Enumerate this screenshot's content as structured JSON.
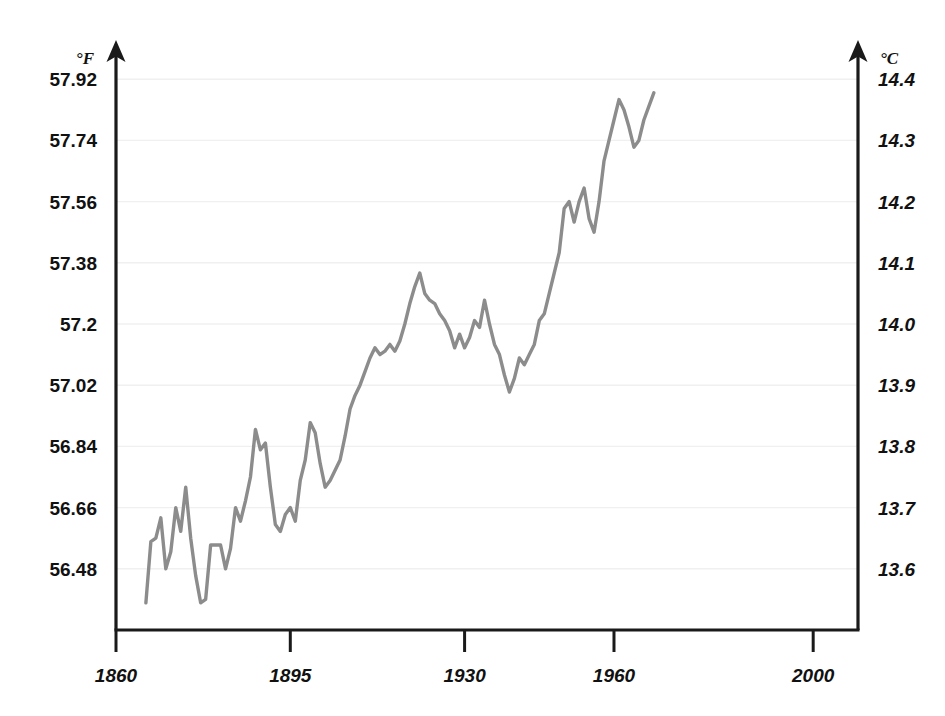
{
  "chart_data": {
    "type": "line",
    "title": "",
    "subtitle": "",
    "xlabel": "",
    "ylabel": "",
    "grid": true,
    "legend": null,
    "line_color": "#8c8c8c",
    "axis_color": "#1a1a1a",
    "grid_color": "#f0f0f0",
    "background": "#ffffff",
    "left_axis": {
      "unit": "°F",
      "ticks": [
        "56.48",
        "56.66",
        "56.84",
        "57.02",
        "57.2",
        "57.38",
        "57.56",
        "57.74",
        "57.92"
      ],
      "values": [
        56.48,
        56.66,
        56.84,
        57.02,
        57.2,
        57.38,
        57.56,
        57.74,
        57.92
      ],
      "ylim": [
        56.3,
        58.0
      ]
    },
    "right_axis": {
      "unit": "°C",
      "ticks": [
        "13.6",
        "13.7",
        "13.8",
        "13.9",
        "14.0",
        "14.1",
        "14.2",
        "14.3",
        "14.4"
      ],
      "values": [
        13.6,
        13.7,
        13.8,
        13.9,
        14.0,
        14.1,
        14.2,
        14.3,
        14.4
      ],
      "ylim": [
        13.5,
        14.444
      ]
    },
    "x_ticks": [
      "1860",
      "1895",
      "1930",
      "1960",
      "2000"
    ],
    "x_tick_values": [
      1860,
      1895,
      1930,
      1960,
      2000
    ],
    "xlim": [
      1860,
      2009
    ],
    "x": [
      1866,
      1867,
      1868,
      1869,
      1870,
      1871,
      1872,
      1873,
      1874,
      1875,
      1876,
      1877,
      1878,
      1879,
      1880,
      1881,
      1882,
      1883,
      1884,
      1885,
      1886,
      1887,
      1888,
      1889,
      1890,
      1891,
      1892,
      1893,
      1894,
      1895,
      1896,
      1897,
      1898,
      1899,
      1900,
      1901,
      1902,
      1903,
      1904,
      1905,
      1906,
      1907,
      1908,
      1909,
      1910,
      1911,
      1912,
      1913,
      1914,
      1915,
      1916,
      1917,
      1918,
      1919,
      1920,
      1921,
      1922,
      1923,
      1924,
      1925,
      1926,
      1927,
      1928,
      1929,
      1930,
      1931,
      1932,
      1933,
      1934,
      1935,
      1936,
      1937,
      1938,
      1939,
      1940,
      1941,
      1942,
      1943,
      1944,
      1945,
      1946,
      1947,
      1948,
      1949,
      1950,
      1951,
      1952,
      1953,
      1954,
      1955,
      1956,
      1957,
      1958,
      1959,
      1960,
      1961,
      1962,
      1963,
      1964,
      1965,
      1966,
      1967,
      1968,
      1969,
      1970,
      1971,
      1972,
      1973,
      1974,
      1975,
      1976,
      1977,
      1978,
      1979,
      1980,
      1981,
      1982,
      1983,
      1984,
      1985,
      1986,
      1987,
      1988,
      1989,
      1990,
      1991,
      1992,
      1993,
      1994,
      1995,
      1996,
      1997,
      1998,
      1999,
      2000,
      2001,
      2002,
      2003,
      2004,
      2005,
      2006
    ],
    "values_f": [
      56.38,
      56.56,
      56.57,
      56.63,
      56.48,
      56.53,
      56.66,
      56.59,
      56.72,
      56.57,
      56.46,
      56.38,
      56.39,
      56.55,
      56.55,
      56.55,
      56.48,
      56.54,
      56.66,
      56.62,
      56.68,
      56.75,
      56.89,
      56.83,
      56.85,
      56.72,
      56.61,
      56.59,
      56.64,
      56.66,
      56.62,
      56.74,
      56.8,
      56.91,
      56.88,
      56.79,
      56.72,
      56.74,
      56.77,
      56.8,
      56.87,
      56.95,
      56.99,
      57.02,
      57.06,
      57.1,
      57.13,
      57.11,
      57.12,
      57.14,
      57.12,
      57.15,
      57.2,
      57.26,
      57.31,
      57.35,
      57.29,
      57.27,
      57.26,
      57.23,
      57.21,
      57.18,
      57.13,
      57.17,
      57.13,
      57.16,
      57.21,
      57.19,
      57.27,
      57.2,
      57.14,
      57.11,
      57.05,
      57.0,
      57.04,
      57.1,
      57.08,
      57.11,
      57.14,
      57.21,
      57.23,
      57.29,
      57.35,
      57.41,
      57.54,
      57.56,
      57.5,
      57.56,
      57.6,
      57.51,
      57.47,
      57.56,
      57.68,
      57.74,
      57.8,
      57.86,
      57.83,
      57.78,
      57.72,
      57.74,
      57.8,
      57.84,
      57.88
    ],
    "values_c": [
      13.54,
      13.64,
      13.65,
      13.68,
      13.6,
      13.63,
      13.7,
      13.66,
      13.73,
      13.65,
      13.59,
      13.54,
      13.55,
      13.64,
      13.64,
      13.64,
      13.6,
      13.63,
      13.7,
      13.68,
      13.71,
      13.75,
      13.83,
      13.79,
      13.81,
      13.73,
      13.67,
      13.66,
      13.69,
      13.7,
      13.68,
      13.74,
      13.78,
      13.84,
      13.82,
      13.77,
      13.73,
      13.74,
      13.76,
      13.78,
      13.82,
      13.86,
      13.88,
      13.9,
      13.92,
      13.94,
      13.96,
      13.95,
      13.96,
      13.97,
      13.96,
      13.97,
      14.0,
      14.03,
      14.06,
      14.08,
      14.05,
      14.04,
      14.03,
      14.02,
      14.01,
      13.99,
      13.96,
      13.98,
      13.96,
      13.98,
      14.01,
      14.0,
      14.04,
      14.0,
      13.97,
      13.95,
      13.92,
      13.89,
      13.91,
      13.94,
      13.93,
      13.95,
      13.96,
      14.0,
      14.02,
      14.05,
      14.08,
      14.12,
      14.19,
      14.2,
      14.17,
      14.2,
      14.22,
      14.17,
      14.15,
      14.2,
      14.27,
      14.3,
      14.33,
      14.37,
      14.35,
      14.32,
      14.29,
      14.3,
      14.33,
      14.36,
      14.38
    ]
  }
}
